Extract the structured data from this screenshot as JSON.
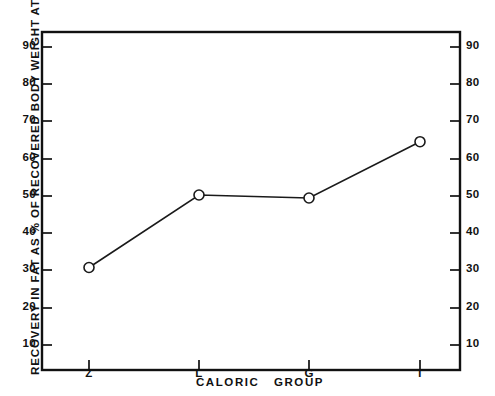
{
  "chart_data": {
    "type": "line",
    "title": "",
    "subtitle": "",
    "xlabel": "CALORIC   GROUP",
    "ylabel": "RECOVERY  IN  FAT  AS  %  OF  RECOVERED  BODY  WEIGHT  AT  RI2",
    "categories": [
      "Z",
      "L",
      "G",
      "T"
    ],
    "values": [
      32.3,
      51.6,
      50.8,
      65.8
    ],
    "series": [
      {
        "name": "Recovery in fat",
        "values": [
          32.3,
          51.6,
          50.8,
          65.8
        ]
      }
    ],
    "ylim": [
      5,
      95
    ],
    "yticks": [
      10,
      20,
      30,
      40,
      50,
      60,
      70,
      80,
      90
    ],
    "ytick_labels": [
      "10",
      "20",
      "30",
      "40",
      "50",
      "60",
      "70",
      "80",
      "90"
    ],
    "ytick_labels_right": [
      "10",
      "20",
      "30",
      "40",
      "50",
      "60",
      "70",
      "80",
      "90"
    ],
    "xtick_labels": [
      "Z",
      "L",
      "G",
      "T"
    ],
    "grid": false,
    "legend": "none",
    "marker": "open-circle",
    "line_color": "#1a1a1a",
    "frame_color": "#111111",
    "background": "#ffffff"
  },
  "axes": {
    "y_left_label_0": "10",
    "y_left_label_1": "20",
    "y_left_label_2": "30",
    "y_left_label_3": "40",
    "y_left_label_4": "50",
    "y_left_label_5": "60",
    "y_left_label_6": "70",
    "y_left_label_7": "80",
    "y_left_label_8": "90",
    "y_right_label_0": "10",
    "y_right_label_1": "20",
    "y_right_label_2": "30",
    "y_right_label_3": "40",
    "y_right_label_4": "50",
    "y_right_label_5": "60",
    "y_right_label_6": "70",
    "y_right_label_7": "80",
    "y_right_label_8": "90",
    "x_label_0": "Z",
    "x_label_1": "L",
    "x_label_2": "G",
    "x_label_3": "T"
  }
}
